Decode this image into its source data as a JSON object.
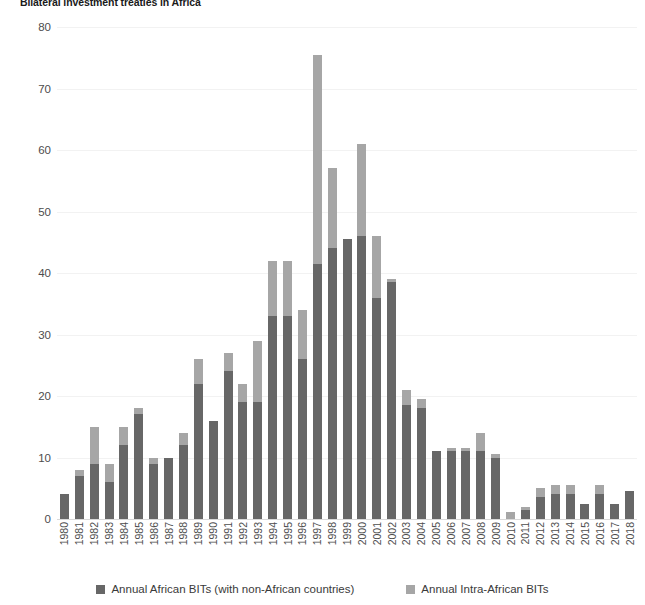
{
  "title": "Bilateral investment treaties in Africa",
  "legend": {
    "series": [
      {
        "label": "Annual African BITs (with non-African countries)",
        "color": "#676767",
        "swatch": "legend-swatch-african-bits"
      },
      {
        "label": "Annual Intra-African BITs",
        "color": "#a6a6a6",
        "swatch": "legend-swatch-intra-african-bits"
      }
    ]
  },
  "axes": {
    "y_ticks": [
      "0",
      "10",
      "20",
      "30",
      "40",
      "50",
      "60",
      "70",
      "80"
    ],
    "y_min": 0,
    "y_max": 80,
    "y_step": 10
  },
  "chart_data": {
    "type": "bar",
    "stacked": true,
    "title": "Bilateral investment treaties in Africa",
    "xlabel": "",
    "ylabel": "",
    "ylim": [
      0,
      80
    ],
    "ytick_step": 10,
    "grid": true,
    "legend_position": "bottom",
    "categories": [
      "1980",
      "1981",
      "1982",
      "1983",
      "1984",
      "1985",
      "1986",
      "1987",
      "1988",
      "1989",
      "1990",
      "1991",
      "1992",
      "1993",
      "1994",
      "1995",
      "1996",
      "1997",
      "1998",
      "1999",
      "2000",
      "2001",
      "2002",
      "2003",
      "2004",
      "2005",
      "2006",
      "2007",
      "2008",
      "2009",
      "2010",
      "2011",
      "2012",
      "2013",
      "2014",
      "2015",
      "2016",
      "2017",
      "2018"
    ],
    "series": [
      {
        "name": "Annual African BITs (with non-African countries)",
        "color": "#676767",
        "values": [
          4,
          7,
          9,
          6,
          12,
          17,
          9,
          10,
          12,
          22,
          16,
          24,
          19,
          19,
          33,
          33,
          26,
          41.5,
          44,
          45.5,
          46,
          36,
          38.5,
          18.5,
          18,
          11,
          11,
          11,
          11,
          10,
          0,
          1.5,
          3.5,
          4,
          4,
          2.5,
          4,
          2.5,
          4.5
        ]
      },
      {
        "name": "Annual Intra-African BITs",
        "color": "#a6a6a6",
        "values": [
          0,
          1,
          6,
          3,
          3,
          1,
          1,
          0,
          2,
          4,
          0,
          3,
          3,
          10,
          9,
          9,
          8,
          34,
          13,
          0,
          15,
          10,
          0.5,
          2.5,
          1.5,
          0,
          0.5,
          0.5,
          3,
          0.5,
          1.2,
          0.5,
          1.5,
          1.5,
          1.5,
          0,
          1.5,
          0,
          0
        ]
      }
    ],
    "totals": [
      4,
      8,
      15,
      9,
      15,
      18,
      10,
      10,
      14,
      26,
      16,
      27,
      22,
      29,
      42,
      42,
      34,
      75.5,
      57,
      45.5,
      61,
      46,
      39,
      21,
      19.5,
      11,
      11.5,
      11.5,
      14,
      10.5,
      1.2,
      2,
      5,
      5.5,
      5.5,
      2.5,
      5.5,
      2.5,
      4.5
    ]
  }
}
